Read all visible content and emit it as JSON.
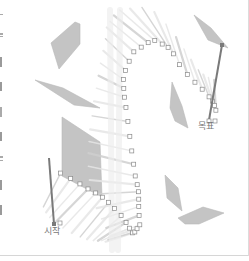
{
  "figure": {
    "type": "motion-planning-visualization",
    "labels": {
      "start": "시작",
      "goal": "목표"
    },
    "colors": {
      "obstacle": "#c4c4c4",
      "obstacle_stroke": "#b8b8b8",
      "trail": "#cfcfcf",
      "trail_light": "#e6e6e6",
      "marker": "#8a8a8a",
      "rod": "#7a7a7a",
      "label": "#777777",
      "frame": "#d6d6d6"
    },
    "start": {
      "rod": [
        [
          49,
          158
        ],
        [
          54,
          224
        ]
      ],
      "label_pos": [
        44,
        228
      ]
    },
    "goal": {
      "rod": [
        [
          222,
          45
        ],
        [
          209,
          120
        ]
      ],
      "label_pos": [
        198,
        122
      ]
    },
    "obstacles": [
      [
        [
          75,
          22
        ],
        [
          80,
          24
        ],
        [
          80,
          44
        ],
        [
          59,
          69
        ],
        [
          51,
          43
        ]
      ],
      [
        [
          35,
          80
        ],
        [
          63,
          88
        ],
        [
          100,
          108
        ],
        [
          74,
          105
        ]
      ],
      [
        [
          62,
          117
        ],
        [
          100,
          142
        ],
        [
          102,
          197
        ],
        [
          62,
          176
        ]
      ],
      [
        [
          194,
          15
        ],
        [
          211,
          28
        ],
        [
          228,
          48
        ],
        [
          208,
          40
        ]
      ],
      [
        [
          172,
          82
        ],
        [
          182,
          106
        ],
        [
          188,
          128
        ],
        [
          175,
          121
        ],
        [
          170,
          108
        ]
      ],
      [
        [
          165,
          175
        ],
        [
          178,
          188
        ],
        [
          182,
          211
        ],
        [
          167,
          198
        ]
      ],
      [
        [
          178,
          218
        ],
        [
          203,
          207
        ],
        [
          224,
          213
        ],
        [
          199,
          224
        ],
        [
          185,
          224
        ]
      ]
    ]
  }
}
